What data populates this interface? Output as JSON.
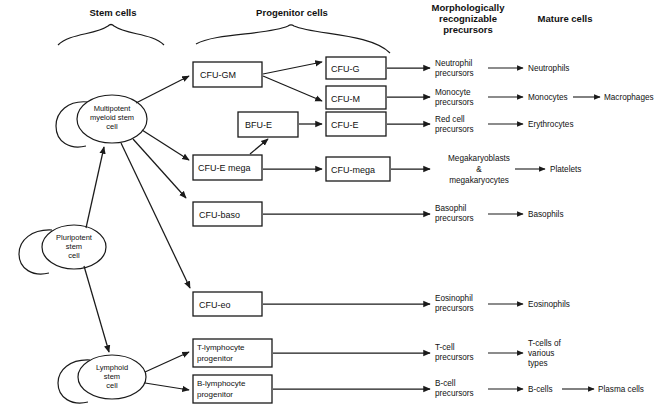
{
  "figure": {
    "type": "flowchart",
    "background_color": "#ffffff",
    "line_color": "#1a1a1a"
  },
  "columns": [
    {
      "id": "stem",
      "title": "Stem cells",
      "has_brace": true
    },
    {
      "id": "progenitor",
      "title": "Progenitor cells",
      "has_brace": true
    },
    {
      "id": "precursors",
      "title_lines": [
        "Morphologically",
        "recognizable",
        "precursors"
      ],
      "has_brace": false
    },
    {
      "id": "mature",
      "title": "Mature cells",
      "has_brace": false
    }
  ],
  "stem_cells": [
    {
      "id": "multipotent-myeloid-stem-cell",
      "lines": [
        "Multipotent",
        "myeloid stem",
        "cell"
      ],
      "self_renewing": true
    },
    {
      "id": "pluripotent-stem-cell",
      "lines": [
        "Pluripotent",
        "stem",
        "cell"
      ],
      "self_renewing": true
    },
    {
      "id": "lymphoid-stem-cell",
      "lines": [
        "Lymphoid",
        "stem",
        "cell"
      ],
      "self_renewing": true
    }
  ],
  "progenitor_boxes": [
    {
      "id": "cfu-gm",
      "label": "CFU-GM"
    },
    {
      "id": "bfu-e",
      "label": "BFU-E"
    },
    {
      "id": "cfu-e-mega",
      "label": "CFU-E mega"
    },
    {
      "id": "cfu-baso",
      "label": "CFU-baso"
    },
    {
      "id": "cfu-eo",
      "label": "CFU-eo"
    },
    {
      "id": "t-lymphocyte-progenitor",
      "lines": [
        "T-lymphocyte",
        "progenitor"
      ]
    },
    {
      "id": "b-lymphocyte-progenitor",
      "lines": [
        "B-lymphocyte",
        "progenitor"
      ]
    },
    {
      "id": "cfu-g",
      "label": "CFU-G"
    },
    {
      "id": "cfu-m",
      "label": "CFU-M"
    },
    {
      "id": "cfu-e",
      "label": "CFU-E"
    },
    {
      "id": "cfu-mega",
      "label": "CFU-mega"
    }
  ],
  "precursors": [
    {
      "id": "neutrophil-precursors",
      "lines": [
        "Neutrophil",
        "precursors"
      ]
    },
    {
      "id": "monocyte-precursors",
      "lines": [
        "Monocyte",
        "precursors"
      ]
    },
    {
      "id": "red-cell-precursors",
      "lines": [
        "Red cell",
        "precursors"
      ]
    },
    {
      "id": "megakaryoblasts",
      "lines": [
        "Megakaryoblasts",
        "&",
        "megakaryocytes"
      ]
    },
    {
      "id": "basophil-precursors",
      "lines": [
        "Basophil",
        "precursors"
      ]
    },
    {
      "id": "eosinophil-precursors",
      "lines": [
        "Eosinophil",
        "precursors"
      ]
    },
    {
      "id": "t-cell-precursors",
      "lines": [
        "T-cell",
        "precursors"
      ]
    },
    {
      "id": "b-cell-precursors",
      "lines": [
        "B-cell",
        "precursors"
      ]
    }
  ],
  "mature_cells": [
    {
      "id": "neutrophils",
      "lines": [
        "Neutrophils"
      ]
    },
    {
      "id": "monocytes",
      "lines": [
        "Monocytes"
      ]
    },
    {
      "id": "erythrocytes",
      "lines": [
        "Erythrocytes"
      ]
    },
    {
      "id": "platelets",
      "lines": [
        "Platelets"
      ]
    },
    {
      "id": "basophils",
      "lines": [
        "Basophils"
      ]
    },
    {
      "id": "eosinophils",
      "lines": [
        "Eosinophils"
      ]
    },
    {
      "id": "t-cells-of-various-types",
      "lines": [
        "T-cells of",
        "various",
        "types"
      ]
    },
    {
      "id": "b-cells",
      "lines": [
        "B-cells"
      ]
    }
  ],
  "terminal_cells": [
    {
      "id": "macrophages",
      "label": "Macrophages"
    },
    {
      "id": "plasma-cells",
      "label": "Plasma cells"
    }
  ]
}
